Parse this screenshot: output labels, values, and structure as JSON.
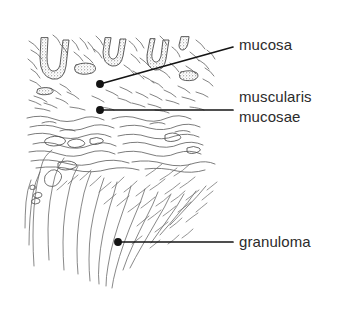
{
  "figure": {
    "kind": "histology-line-drawing",
    "background_color": "#ffffff",
    "ink_color": "#3a3a3a",
    "leader_color": "#1a1a1a",
    "text_color": "#2b2b2b",
    "width": 342,
    "height": 324
  },
  "labels": {
    "mucosa": "mucosa",
    "muscularis": "muscularis",
    "mucosae": "mucosae",
    "granuloma": "granuloma"
  },
  "leaders": [
    {
      "name": "mucosa",
      "dot": {
        "x": 100,
        "y": 84
      },
      "end": {
        "x": 233,
        "y": 47
      }
    },
    {
      "name": "muscularis-mucosae",
      "dot": {
        "x": 100,
        "y": 110
      },
      "end": {
        "x": 233,
        "y": 110
      }
    },
    {
      "name": "granuloma",
      "dot": {
        "x": 118,
        "y": 242
      },
      "end": {
        "x": 233,
        "y": 242
      }
    }
  ],
  "regions": [
    {
      "name": "mucosa-crypt-zone",
      "top": 35,
      "bottom": 112
    },
    {
      "name": "muscularis-mucosae-zone",
      "top": 112,
      "bottom": 168
    },
    {
      "name": "granuloma-submucosa-zone",
      "top": 168,
      "bottom": 312
    }
  ]
}
